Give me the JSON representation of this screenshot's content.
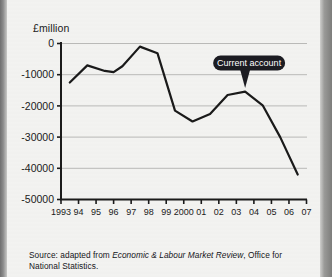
{
  "figure": {
    "y_axis_title": "£million",
    "source_prefix": "Source: adapted from ",
    "source_italic": "Economic & Labour Market Review",
    "source_suffix": ", Office for National Statistics.",
    "callout_label": "Current account",
    "colors": {
      "paper": "#f3f3f1",
      "ink": "#1b1b1b",
      "line": "#1a1a1a",
      "gridline": "#b9b9b7",
      "callout_fill": "#1c1c22",
      "callout_text": "#ffffff"
    }
  },
  "chart_data": {
    "type": "line",
    "title": "",
    "subtitle": "",
    "xlabel": "",
    "ylabel": "£million",
    "ylim": [
      -50000,
      0
    ],
    "xlim": [
      1993,
      2007
    ],
    "grid": true,
    "legend": false,
    "ytick_labels": [
      "0",
      "-10000",
      "-20000",
      "-30000",
      "-40000",
      "-50000"
    ],
    "ytick_values": [
      0,
      -10000,
      -20000,
      -30000,
      -40000,
      -50000
    ],
    "xtick_labels": [
      "1993",
      "94",
      "95",
      "96",
      "97",
      "98",
      "99",
      "2000",
      "01",
      "02",
      "03",
      "04",
      "05",
      "06",
      "07"
    ],
    "xtick_values": [
      1993,
      1994,
      1995,
      1996,
      1997,
      1998,
      1999,
      2000,
      2001,
      2002,
      2003,
      2004,
      2005,
      2006,
      2007
    ],
    "series": [
      {
        "name": "Current account",
        "x": [
          1993.5,
          1994.5,
          1995.5,
          1996.0,
          1996.5,
          1997.5,
          1998.5,
          1999.5,
          2000.5,
          2001.5,
          2002.5,
          2003.5,
          2004.5,
          2005.5,
          2006.5
        ],
        "values": [
          -12500,
          -7000,
          -8800,
          -9200,
          -7300,
          -1000,
          -3100,
          -21500,
          -25000,
          -22600,
          -16500,
          -15400,
          -19800,
          -30000,
          -42000
        ]
      }
    ],
    "annotations": [
      {
        "label": "Current account",
        "points_to_x": 2003.5,
        "points_to_y": -15400
      }
    ]
  }
}
